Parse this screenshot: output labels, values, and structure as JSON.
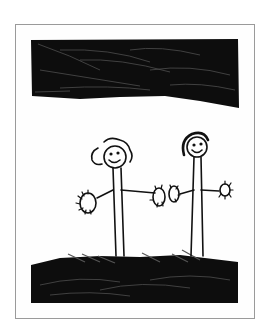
{
  "image": {
    "description": "Child's marker drawing of two smiling stick figures holding hands between a scribbled black sky band and black grassy ground, inside a thin grey frame",
    "colors": {
      "background": "#ffffff",
      "frame_border": "#9a9a9a",
      "ink": "#111111",
      "paper": "#fefefe"
    },
    "elements": {
      "sky": "black scribbled band across the top",
      "figure_left": "stick figure with curly hair and smile",
      "figure_right": "stick figure with dark hair and smile",
      "ground": "black scribbled grass strip across the bottom"
    }
  }
}
